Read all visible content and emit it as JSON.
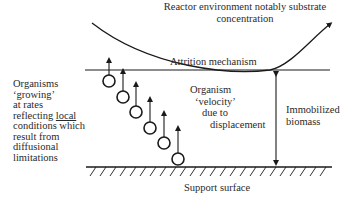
{
  "labels": {
    "reactor_environment_line1": "Reactor environment notably substrate",
    "reactor_environment_line2": "concentration",
    "attrition": "Attrition mechanism",
    "organism_velocity": [
      "Organism",
      "‘velocity’",
      "due to",
      "displacement"
    ],
    "immobilized_biomass": [
      "Immobilized",
      "biomass"
    ],
    "support_surface": "Support surface",
    "organisms_growing": {
      "line1": "Organisms",
      "line2": "‘growing’",
      "line3": "at rates",
      "line4_prefix": "reflecting ",
      "line4_underlined": "local",
      "line5": "conditions which",
      "line6": "result from",
      "line7": "diffusional",
      "line8": "limitations"
    }
  },
  "colors": {
    "ink": "#1a1a1a",
    "background": "#ffffff"
  }
}
